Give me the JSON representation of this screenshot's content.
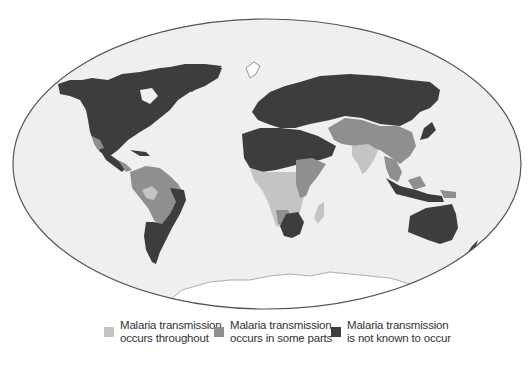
{
  "map": {
    "projection": "elliptical world map",
    "colors": {
      "ocean": "#efefef",
      "border": "#555555",
      "throughout": "#c4c4c4",
      "some_parts": "#8f8f8f",
      "not_known": "#3d3d3d",
      "ice": "#ffffff"
    }
  },
  "legend": {
    "items": [
      {
        "key": "throughout",
        "line1": "Malaria transmission",
        "line2": "occurs throughout",
        "color": "#c4c4c4"
      },
      {
        "key": "some_parts",
        "line1": "Malaria transmission",
        "line2": "occurs in some parts",
        "color": "#8f8f8f"
      },
      {
        "key": "not_known",
        "line1": "Malaria transmission",
        "line2": "is not known to occur",
        "color": "#3d3d3d"
      }
    ]
  }
}
